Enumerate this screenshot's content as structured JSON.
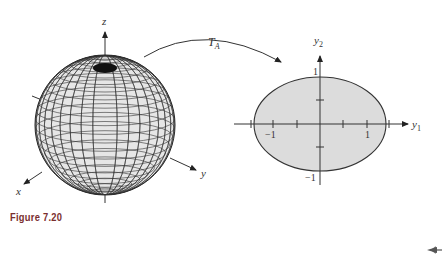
{
  "figure": {
    "caption": "Figure 7.20",
    "mapping_label": "T",
    "mapping_subscript": "A",
    "sphere": {
      "axes": {
        "x": "x",
        "y": "y",
        "z": "z"
      }
    },
    "ellipse": {
      "axis_h_label": "y",
      "axis_h_sub": "1",
      "axis_v_label": "y",
      "axis_v_sub": "2",
      "tick_neg1_h": "−1",
      "tick_pos1_h": "1",
      "tick_pos1_v": "1",
      "tick_neg1_v": "−1",
      "semi_axis_h": 1.4,
      "semi_axis_v": 1.0,
      "fill_color": "#d9d9d9"
    }
  },
  "nav": {
    "back_arrow": "back-arrow-icon"
  }
}
